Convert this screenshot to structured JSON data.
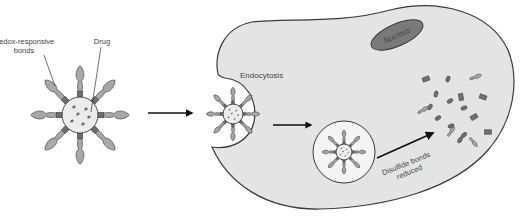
{
  "labels": {
    "redox_line1": "Redox-responsive",
    "redox_line2": "bonds",
    "drug": "Drug",
    "endocytosis": "Endocytosis",
    "nucleus": "Nucleus",
    "disulfide_line1": "Disulfide bonds",
    "disulfide_line2": "reduced"
  },
  "colors": {
    "cell_fill": "#e4e4e4",
    "outline": "#3a3a3a",
    "nucleus_fill": "#7a7a7a",
    "ligand_fill": "#a8a8a8",
    "linker_fill": "#6e6e6e",
    "core_fill": "#ececec",
    "drug_dot": "#707070",
    "arrow": "#111111",
    "vesicle_fill": "#f4f4f4",
    "text": "#444444"
  },
  "nanoparticle": {
    "arm_count": 8,
    "drug_dot_count": 6
  }
}
